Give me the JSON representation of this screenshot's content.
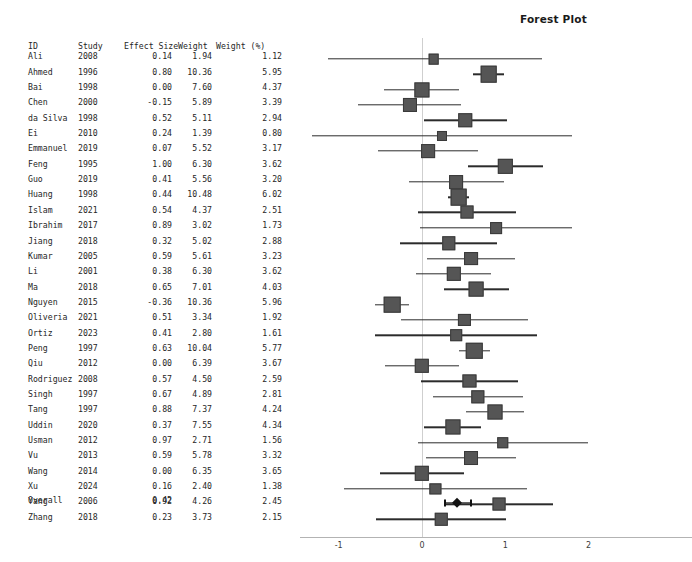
{
  "chart_data": {
    "type": "forest",
    "title": "Forest Plot",
    "xlabel": "",
    "ylabel": "",
    "xlim": [
      -1.6,
      2.35
    ],
    "xticks": [
      -1,
      0,
      1,
      2
    ],
    "xticklabels": [
      "-1",
      "0",
      "1",
      "2"
    ],
    "grid": false,
    "reference_line": 0,
    "columns": [
      "ID",
      "Study",
      "Effect Size",
      "Weight",
      "Weight (%)"
    ],
    "rows": [
      {
        "id": "Ali",
        "study": "2008",
        "effect": "0.14",
        "weight": "1.94",
        "weight_pct": "1.12",
        "effect_value": 0.14,
        "weight_value": 1.94,
        "ci_low": -1.13,
        "ci_high": 1.44
      },
      {
        "id": "Ahmed",
        "study": "1996",
        "effect": "0.80",
        "weight": "10.36",
        "weight_pct": "5.95",
        "effect_value": 0.8,
        "weight_value": 10.36,
        "ci_low": 0.61,
        "ci_high": 0.99
      },
      {
        "id": "Bai",
        "study": "1998",
        "effect": "0.00",
        "weight": "7.60",
        "weight_pct": "4.37",
        "effect_value": 0.0,
        "weight_value": 7.6,
        "ci_low": -0.46,
        "ci_high": 0.45
      },
      {
        "id": "Chen",
        "study": "2000",
        "effect": "-0.15",
        "weight": "5.89",
        "weight_pct": "3.39",
        "effect_value": -0.15,
        "weight_value": 5.89,
        "ci_low": -0.77,
        "ci_high": 0.47
      },
      {
        "id": "da Silva",
        "study": "1998",
        "effect": "0.52",
        "weight": "5.11",
        "weight_pct": "2.94",
        "effect_value": 0.52,
        "weight_value": 5.11,
        "ci_low": 0.03,
        "ci_high": 1.02
      },
      {
        "id": "Ei",
        "study": "2010",
        "effect": "0.24",
        "weight": "1.39",
        "weight_pct": "0.80",
        "effect_value": 0.24,
        "weight_value": 1.39,
        "ci_low": -1.32,
        "ci_high": 1.8
      },
      {
        "id": "Emmanuel",
        "study": "2019",
        "effect": "0.07",
        "weight": "5.52",
        "weight_pct": "3.17",
        "effect_value": 0.07,
        "weight_value": 5.52,
        "ci_low": -0.53,
        "ci_high": 0.67
      },
      {
        "id": "Feng",
        "study": "1995",
        "effect": "1.00",
        "weight": "6.30",
        "weight_pct": "3.62",
        "effect_value": 1.0,
        "weight_value": 6.3,
        "ci_low": 0.55,
        "ci_high": 1.45
      },
      {
        "id": "Guo",
        "study": "2019",
        "effect": "0.41",
        "weight": "5.56",
        "weight_pct": "3.20",
        "effect_value": 0.41,
        "weight_value": 5.56,
        "ci_low": -0.16,
        "ci_high": 0.98
      },
      {
        "id": "Huang",
        "study": "1998",
        "effect": "0.44",
        "weight": "10.48",
        "weight_pct": "6.02",
        "effect_value": 0.44,
        "weight_value": 10.48,
        "ci_low": 0.31,
        "ci_high": 0.57
      },
      {
        "id": "Islam",
        "study": "2021",
        "effect": "0.54",
        "weight": "4.37",
        "weight_pct": "2.51",
        "effect_value": 0.54,
        "weight_value": 4.37,
        "ci_low": -0.05,
        "ci_high": 1.13
      },
      {
        "id": "Ibrahim",
        "study": "2017",
        "effect": "0.89",
        "weight": "3.02",
        "weight_pct": "1.73",
        "effect_value": 0.89,
        "weight_value": 3.02,
        "ci_low": -0.02,
        "ci_high": 1.8
      },
      {
        "id": "Jiang",
        "study": "2018",
        "effect": "0.32",
        "weight": "5.02",
        "weight_pct": "2.88",
        "effect_value": 0.32,
        "weight_value": 5.02,
        "ci_low": -0.26,
        "ci_high": 0.9
      },
      {
        "id": "Kumar",
        "study": "2005",
        "effect": "0.59",
        "weight": "5.61",
        "weight_pct": "3.23",
        "effect_value": 0.59,
        "weight_value": 5.61,
        "ci_low": 0.06,
        "ci_high": 1.12
      },
      {
        "id": "Li",
        "study": "2001",
        "effect": "0.38",
        "weight": "6.30",
        "weight_pct": "3.62",
        "effect_value": 0.38,
        "weight_value": 6.3,
        "ci_low": -0.07,
        "ci_high": 0.83
      },
      {
        "id": "Ma",
        "study": "2018",
        "effect": "0.65",
        "weight": "7.01",
        "weight_pct": "4.03",
        "effect_value": 0.65,
        "weight_value": 7.01,
        "ci_low": 0.26,
        "ci_high": 1.04
      },
      {
        "id": "Nguyen",
        "study": "2015",
        "effect": "-0.36",
        "weight": "10.36",
        "weight_pct": "5.96",
        "effect_value": -0.36,
        "weight_value": 10.36,
        "ci_low": -0.56,
        "ci_high": -0.16
      },
      {
        "id": "Oliveria",
        "study": "2021",
        "effect": "0.51",
        "weight": "3.34",
        "weight_pct": "1.92",
        "effect_value": 0.51,
        "weight_value": 3.34,
        "ci_low": -0.25,
        "ci_high": 1.27
      },
      {
        "id": "Ortiz",
        "study": "2023",
        "effect": "0.41",
        "weight": "2.80",
        "weight_pct": "1.61",
        "effect_value": 0.41,
        "weight_value": 2.8,
        "ci_low": -0.56,
        "ci_high": 1.38
      },
      {
        "id": "Peng",
        "study": "1997",
        "effect": "0.63",
        "weight": "10.04",
        "weight_pct": "5.77",
        "effect_value": 0.63,
        "weight_value": 10.04,
        "ci_low": 0.44,
        "ci_high": 0.82
      },
      {
        "id": "Qiu",
        "study": "2012",
        "effect": "0.00",
        "weight": "6.39",
        "weight_pct": "3.67",
        "effect_value": 0.0,
        "weight_value": 6.39,
        "ci_low": -0.44,
        "ci_high": 0.44
      },
      {
        "id": "Rodriguez",
        "study": "2008",
        "effect": "0.57",
        "weight": "4.50",
        "weight_pct": "2.59",
        "effect_value": 0.57,
        "weight_value": 4.5,
        "ci_low": -0.01,
        "ci_high": 1.15
      },
      {
        "id": "Singh",
        "study": "1997",
        "effect": "0.67",
        "weight": "4.89",
        "weight_pct": "2.81",
        "effect_value": 0.67,
        "weight_value": 4.89,
        "ci_low": 0.13,
        "ci_high": 1.21
      },
      {
        "id": "Tang",
        "study": "1997",
        "effect": "0.88",
        "weight": "7.37",
        "weight_pct": "4.24",
        "effect_value": 0.88,
        "weight_value": 7.37,
        "ci_low": 0.53,
        "ci_high": 1.23
      },
      {
        "id": "Uddin",
        "study": "2020",
        "effect": "0.37",
        "weight": "7.55",
        "weight_pct": "4.34",
        "effect_value": 0.37,
        "weight_value": 7.55,
        "ci_low": 0.03,
        "ci_high": 0.71
      },
      {
        "id": "Usman",
        "study": "2012",
        "effect": "0.97",
        "weight": "2.71",
        "weight_pct": "1.56",
        "effect_value": 0.97,
        "weight_value": 2.71,
        "ci_low": -0.05,
        "ci_high": 1.99
      },
      {
        "id": "Vu",
        "study": "2013",
        "effect": "0.59",
        "weight": "5.78",
        "weight_pct": "3.32",
        "effect_value": 0.59,
        "weight_value": 5.78,
        "ci_low": 0.05,
        "ci_high": 1.13
      },
      {
        "id": "Wang",
        "study": "2014",
        "effect": "0.00",
        "weight": "6.35",
        "weight_pct": "3.65",
        "effect_value": 0.0,
        "weight_value": 6.35,
        "ci_low": -0.5,
        "ci_high": 0.5
      },
      {
        "id": "Xu",
        "study": "2024",
        "effect": "0.16",
        "weight": "2.40",
        "weight_pct": "1.38",
        "effect_value": 0.16,
        "weight_value": 2.4,
        "ci_low": -0.94,
        "ci_high": 1.26
      },
      {
        "id": "Yang",
        "study": "2006",
        "effect": "0.92",
        "weight": "4.26",
        "weight_pct": "2.45",
        "effect_value": 0.92,
        "weight_value": 4.26,
        "ci_low": 0.27,
        "ci_high": 1.57
      },
      {
        "id": "Zhang",
        "study": "2018",
        "effect": "0.23",
        "weight": "3.73",
        "weight_pct": "2.15",
        "effect_value": 0.23,
        "weight_value": 3.73,
        "ci_low": -0.55,
        "ci_high": 1.01
      }
    ],
    "overall": {
      "id": "Overall",
      "study": "",
      "effect": "0.42",
      "weight": "",
      "weight_pct": "",
      "effect_value": 0.42,
      "ci_low": 0.35,
      "ci_high": 0.49,
      "whisker_low": 0.27,
      "whisker_high": 0.58
    },
    "colors": {
      "marker": "#555555",
      "marker_edge": "#3a3a3a",
      "ci_line": "#2b2b2b",
      "diamond": "#111111",
      "zero_line": "#cfcfcf",
      "axis": "#b3b3b3",
      "text": "#262626"
    }
  }
}
